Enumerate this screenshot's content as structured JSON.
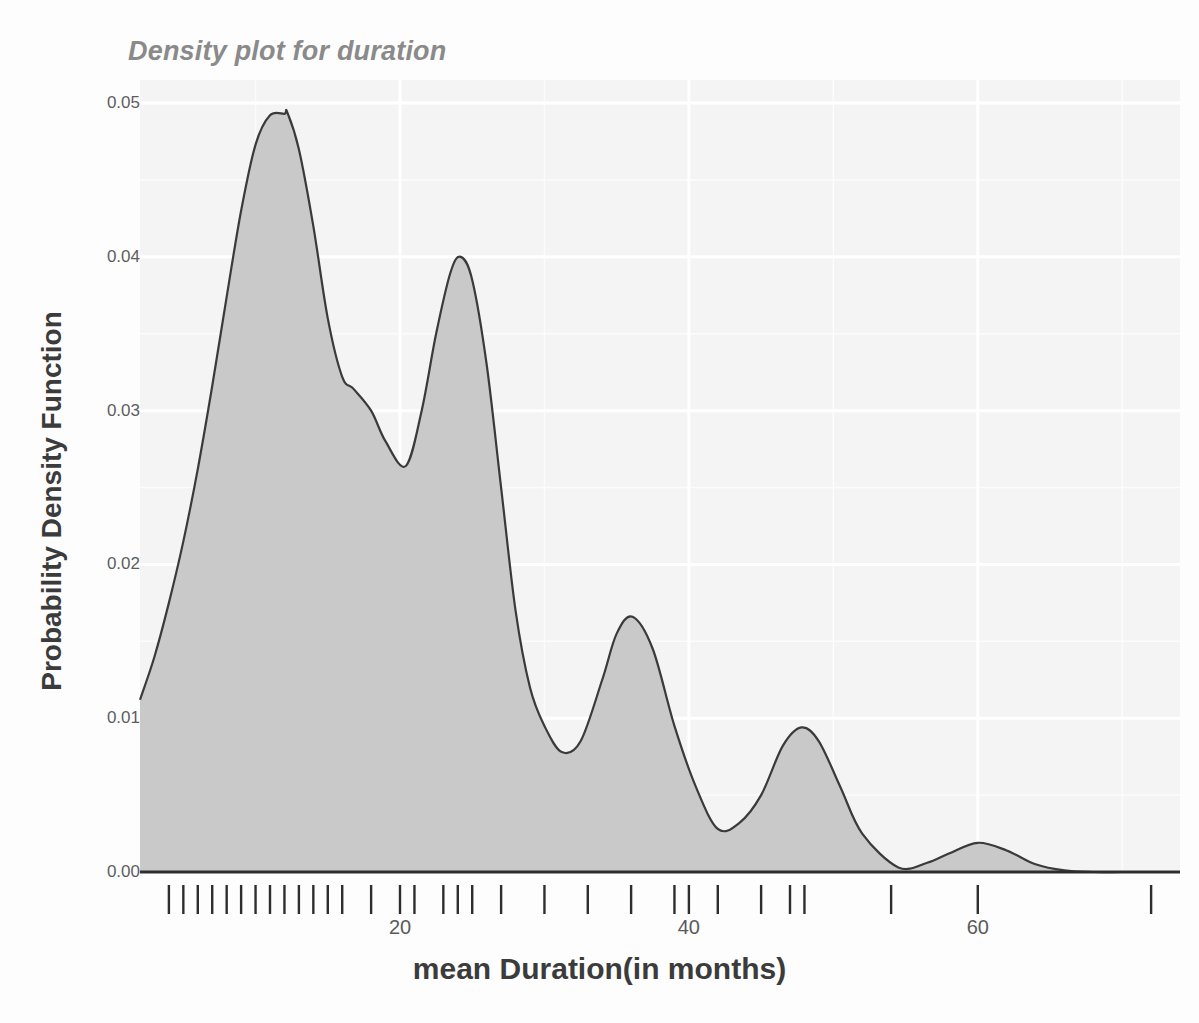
{
  "chart_data": {
    "type": "area",
    "title": "Density plot for duration",
    "xlabel": "mean Duration(in months)",
    "ylabel": "Probability Density Function",
    "xlim": [
      2,
      74
    ],
    "ylim": [
      0.0,
      0.0515
    ],
    "grid": true,
    "legend": null,
    "xticks": [
      20,
      40,
      60
    ],
    "xtick_labels": [
      "20",
      "40",
      "60"
    ],
    "yticks": [
      0.0,
      0.01,
      0.02,
      0.03,
      0.04,
      0.05
    ],
    "ytick_labels": [
      "0.00",
      "0.01",
      "0.02",
      "0.03",
      "0.04",
      "0.05"
    ],
    "series_name": "duration density",
    "fill_color": "#c9c9c9",
    "line_color": "#3a3a3a",
    "panel_color": "#f4f4f4",
    "grid_color": "#ffffff",
    "peaks": [
      {
        "x": 12.2,
        "y": 0.0494
      },
      {
        "x": 24.2,
        "y": 0.04
      },
      {
        "x": 36.1,
        "y": 0.0166
      },
      {
        "x": 47.8,
        "y": 0.0094
      },
      {
        "x": 60.0,
        "y": 0.0019
      }
    ],
    "valleys": [
      {
        "x": 16.8,
        "y": 0.0314
      },
      {
        "x": 20.4,
        "y": 0.0264
      },
      {
        "x": 31.2,
        "y": 0.0078
      },
      {
        "x": 42.0,
        "y": 0.0028
      },
      {
        "x": 54.5,
        "y": 0.0003
      }
    ],
    "x": [
      2.0,
      3.0,
      4.0,
      5.0,
      6.0,
      7.0,
      8.0,
      9.0,
      10.0,
      11.0,
      12.0,
      12.2,
      13.0,
      14.0,
      15.0,
      16.0,
      16.8,
      18.0,
      19.0,
      20.4,
      21.5,
      22.5,
      23.5,
      24.2,
      25.0,
      26.0,
      27.0,
      28.0,
      29.0,
      30.0,
      31.2,
      32.5,
      34.0,
      35.0,
      36.1,
      37.5,
      39.0,
      40.5,
      42.0,
      43.5,
      45.0,
      46.5,
      47.8,
      49.0,
      50.5,
      52.0,
      54.5,
      56.5,
      58.0,
      60.0,
      62.0,
      64.0,
      66.0,
      68.0,
      70.0,
      72.0,
      74.0
    ],
    "y": [
      0.0112,
      0.014,
      0.0175,
      0.0215,
      0.0262,
      0.0316,
      0.0374,
      0.043,
      0.0473,
      0.0492,
      0.0493,
      0.0494,
      0.047,
      0.042,
      0.036,
      0.0322,
      0.0314,
      0.03,
      0.028,
      0.0264,
      0.03,
      0.035,
      0.039,
      0.04,
      0.0385,
      0.033,
      0.025,
      0.017,
      0.012,
      0.0095,
      0.0078,
      0.0085,
      0.0125,
      0.0155,
      0.0166,
      0.0145,
      0.0095,
      0.0055,
      0.0028,
      0.0032,
      0.005,
      0.0082,
      0.0094,
      0.0085,
      0.0055,
      0.0025,
      0.0003,
      0.0006,
      0.0012,
      0.0019,
      0.0014,
      0.0005,
      0.0001,
      0.0,
      0.0,
      0.0,
      0.0
    ],
    "rug_values": [
      4.0,
      5.0,
      6.0,
      7.0,
      8.0,
      9.0,
      10.0,
      11.0,
      12.0,
      13.0,
      14.0,
      15.0,
      16.0,
      18.0,
      20.0,
      21.0,
      23.0,
      24.0,
      25.0,
      27.0,
      30.0,
      33.0,
      36.0,
      39.0,
      40.0,
      42.0,
      45.0,
      47.0,
      48.0,
      54.0,
      60.0,
      72.0
    ],
    "rug_label": "data rug marks"
  }
}
